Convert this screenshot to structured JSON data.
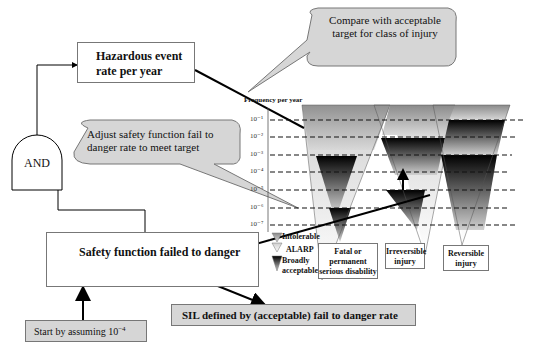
{
  "boxes": {
    "hazardous_event": "Hazardous event rate per year",
    "and_gate": "AND",
    "safety_function": "Safety function failed  to danger",
    "start_assumption_prefix": "Start by assuming 10",
    "start_assumption_exp": "−4",
    "sil_defined": "SIL defined by (acceptable) fail to danger rate"
  },
  "callouts": {
    "compare": "Compare with acceptable target for class of injury",
    "adjust": "Adjust safety function fail to danger rate to meet target"
  },
  "frequency_chart": {
    "axis_title": "Frequency per year",
    "ticks": [
      "10⁻¹",
      "10⁻²",
      "10⁻³",
      "10⁻⁴",
      "10⁻⁵",
      "10⁻⁶",
      "10⁻⁷"
    ],
    "categories": [
      "Fatal or permanent serious disability",
      "Irreversible injury",
      "Reversible injury"
    ],
    "legend": [
      "Intolerable",
      "ALARP",
      "Broadly acceptable"
    ]
  }
}
